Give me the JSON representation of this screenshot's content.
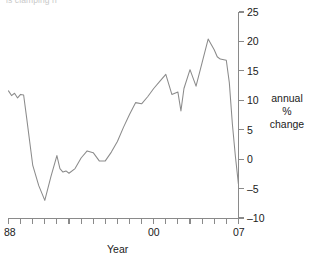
{
  "figure": {
    "cut_caption": "is clamping n",
    "background_color": "#ffffff",
    "line_color": "#8b8b8b",
    "axis_color": "#8a8a8a"
  },
  "series_label": {
    "line1": "annual",
    "line2": "%",
    "line3": "change"
  },
  "chart_data": {
    "type": "line",
    "title": "",
    "subtitle": "",
    "xlabel": "Year",
    "ylabel": "annual % change",
    "legend": [],
    "legend_position": "right",
    "grid": false,
    "xlim": [
      1988,
      2007
    ],
    "ylim": [
      -10,
      25
    ],
    "y_ticks": [
      -10,
      -5,
      0,
      5,
      10,
      15,
      20,
      25
    ],
    "y_tick_labels": [
      "–10",
      "–5",
      "0",
      "5",
      "10",
      "15",
      "20",
      "25"
    ],
    "y_axis_side": "right",
    "x_ticks": [
      1988,
      1989,
      1990,
      1991,
      1992,
      1993,
      1994,
      1995,
      1996,
      1997,
      1998,
      1999,
      2000,
      2001,
      2002,
      2003,
      2004,
      2005,
      2006,
      2007
    ],
    "x_tick_labels_shown": [
      "88",
      "00",
      "07"
    ],
    "x_tick_label_positions": [
      1988,
      2000,
      2007
    ],
    "series": [
      {
        "name": "annual % change",
        "x": [
          1988.0,
          1988.25,
          1988.5,
          1988.75,
          1989.0,
          1989.25,
          1989.5,
          1989.75,
          1990.0,
          1990.5,
          1991.0,
          1991.5,
          1992.0,
          1992.25,
          1992.5,
          1992.75,
          1993.0,
          1993.5,
          1994.0,
          1994.5,
          1995.0,
          1995.5,
          1996.0,
          1996.5,
          1997.0,
          1997.5,
          1998.0,
          1998.5,
          1999.0,
          1999.5,
          2000.0,
          2000.5,
          2001.0,
          2001.5,
          2002.0,
          2002.25,
          2002.5,
          2003.0,
          2003.5,
          2004.0,
          2004.5,
          2005.0,
          2005.25,
          2005.5,
          2006.0,
          2006.25,
          2006.5,
          2006.75,
          2007.0
        ],
        "y": [
          11.6,
          10.8,
          11.2,
          10.4,
          11.0,
          10.9,
          7.0,
          3.0,
          -1.0,
          -4.5,
          -7.0,
          -3.0,
          0.6,
          -1.6,
          -2.2,
          -2.0,
          -2.4,
          -1.6,
          0.2,
          1.4,
          1.1,
          -0.3,
          -0.3,
          1.2,
          3.0,
          5.4,
          7.6,
          9.6,
          9.4,
          10.6,
          12.0,
          13.2,
          14.4,
          11.0,
          11.4,
          8.2,
          12.0,
          15.2,
          12.4,
          16.4,
          20.4,
          18.6,
          17.4,
          17.0,
          16.8,
          13.0,
          6.0,
          0.5,
          -4.2
        ]
      }
    ],
    "annotations": []
  },
  "axis_titles": {
    "x": "Year"
  }
}
